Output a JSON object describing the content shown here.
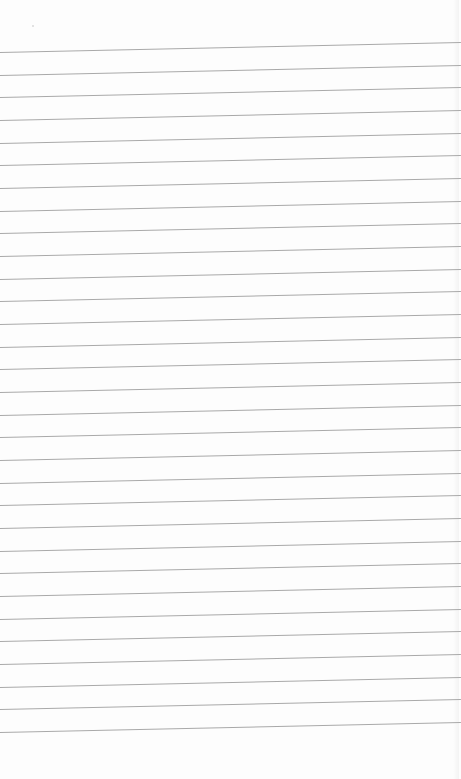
{
  "image": {
    "subject": "lined-paper",
    "background_color": "#fdfdfd",
    "line_color": "#a9a9a9",
    "line_count": 31,
    "first_line_y_left": 52,
    "line_spacing_px": 22.67,
    "slope_rise_px": -10
  }
}
